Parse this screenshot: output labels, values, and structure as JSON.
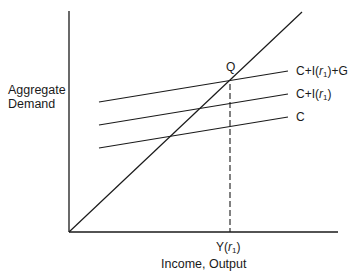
{
  "diagram": {
    "y_axis_label_line1": "Aggregate",
    "y_axis_label_line2": "Demand",
    "x_axis_label": "Income, Output",
    "equilibrium_point_label": "Q",
    "equilibrium_income_label": {
      "prefix": "Y(",
      "var": "r",
      "sub": "1",
      "suffix": ")"
    },
    "lines": [
      {
        "name": "C+I+G",
        "label": {
          "prefix": "C+I(",
          "var": "r",
          "sub": "1",
          "suffix": ")+G"
        }
      },
      {
        "name": "C+I",
        "label": {
          "prefix": "C+I(",
          "var": "r",
          "sub": "1",
          "suffix": ")"
        }
      },
      {
        "name": "C",
        "label": {
          "prefix": "C",
          "var": "",
          "sub": "",
          "suffix": ""
        }
      }
    ],
    "line_color": "#1a1a1a"
  }
}
